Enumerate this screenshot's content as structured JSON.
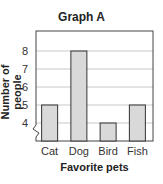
{
  "chart_data": {
    "type": "bar",
    "title": "Graph A",
    "xlabel": "Favorite pets",
    "ylabel": "Number of people",
    "categories": [
      "Cat",
      "Dog",
      "Bird",
      "Fish"
    ],
    "values": [
      5,
      8,
      4,
      5
    ],
    "yticks": [
      4,
      5,
      6,
      7,
      8
    ],
    "ylim": [
      3,
      9
    ],
    "axis_break": true,
    "grid": true,
    "bar_color": "#d9d9d9",
    "bar_edge_color": "#333333"
  }
}
